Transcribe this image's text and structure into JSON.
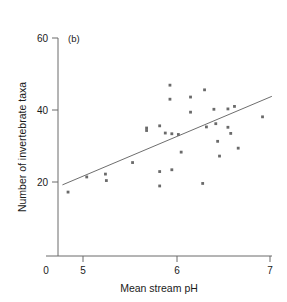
{
  "chart_data": {
    "type": "scatter",
    "title": "",
    "panel_label": "(b)",
    "xlabel": "Mean stream pH",
    "ylabel": "Number of invertebrate taxa",
    "xlim": [
      4.7,
      7.05
    ],
    "ylim": [
      0,
      60
    ],
    "x_ticks": [
      0,
      5,
      6,
      7
    ],
    "x_tick_labels": [
      "0",
      "5",
      "6",
      "7"
    ],
    "y_ticks": [
      0,
      20,
      40,
      60
    ],
    "y_tick_labels": [
      "0",
      "20",
      "40",
      "60"
    ],
    "grid": false,
    "legend": "none",
    "axis_note": "x-axis broken between 0 and 5",
    "points": [
      {
        "x": 4.84,
        "y": 17.2
      },
      {
        "x": 5.04,
        "y": 21.4
      },
      {
        "x": 5.24,
        "y": 22.2
      },
      {
        "x": 5.25,
        "y": 20.4
      },
      {
        "x": 5.53,
        "y": 25.4
      },
      {
        "x": 5.68,
        "y": 35.0
      },
      {
        "x": 5.68,
        "y": 34.3
      },
      {
        "x": 5.82,
        "y": 35.6
      },
      {
        "x": 5.82,
        "y": 22.9
      },
      {
        "x": 5.82,
        "y": 18.9
      },
      {
        "x": 5.88,
        "y": 33.6
      },
      {
        "x": 5.93,
        "y": 46.9
      },
      {
        "x": 5.93,
        "y": 43.0
      },
      {
        "x": 5.95,
        "y": 33.4
      },
      {
        "x": 5.95,
        "y": 23.4
      },
      {
        "x": 6.02,
        "y": 33.2
      },
      {
        "x": 6.05,
        "y": 28.3
      },
      {
        "x": 6.15,
        "y": 43.6
      },
      {
        "x": 6.15,
        "y": 39.4
      },
      {
        "x": 6.28,
        "y": 19.6
      },
      {
        "x": 6.3,
        "y": 45.6
      },
      {
        "x": 6.32,
        "y": 35.3
      },
      {
        "x": 6.4,
        "y": 40.2
      },
      {
        "x": 6.42,
        "y": 36.2
      },
      {
        "x": 6.44,
        "y": 31.3
      },
      {
        "x": 6.46,
        "y": 27.2
      },
      {
        "x": 6.55,
        "y": 40.3
      },
      {
        "x": 6.55,
        "y": 35.2
      },
      {
        "x": 6.58,
        "y": 33.5
      },
      {
        "x": 6.62,
        "y": 41.0
      },
      {
        "x": 6.66,
        "y": 29.4
      },
      {
        "x": 6.92,
        "y": 38.1
      }
    ],
    "fit_line": {
      "label": "regression line",
      "x_start": 4.78,
      "y_start": 19.2,
      "x_end": 7.02,
      "y_end": 43.8
    }
  }
}
